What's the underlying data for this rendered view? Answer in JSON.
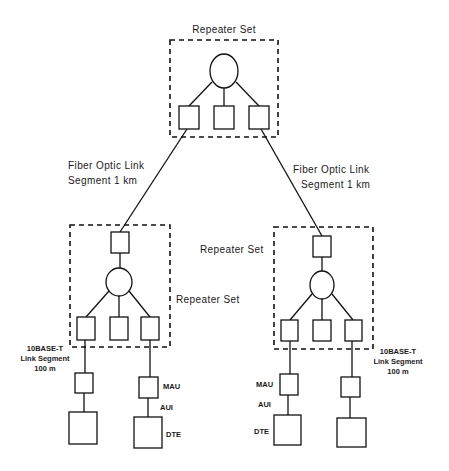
{
  "diagram": {
    "colors": {
      "line": "#111111",
      "background": "#ffffff"
    },
    "labels": {
      "top_repeater_set": "Repeater Set",
      "fiber_left_line1": "Fiber Optic Link",
      "fiber_left_line2": "Segment 1 km",
      "fiber_right_line1": "Fiber Optic Link",
      "fiber_right_line2": "Segment 1 km",
      "mid_repeater_set_upper": "Repeater Set",
      "mid_repeater_set_lower": "Repeater Set",
      "left_10baset_line1": "10BASE-T",
      "left_10baset_line2": "Link Segment",
      "left_10baset_line3": "100 m",
      "right_10baset_line1": "10BASE-T",
      "right_10baset_line2": "Link Segment",
      "right_10baset_line3": "100 m",
      "left_mau": "MAU",
      "left_aui": "AUI",
      "left_dte": "DTE",
      "right_mau": "MAU",
      "right_aui": "AUI",
      "right_dte": "DTE"
    },
    "nodes": [
      {
        "id": "top-repeater",
        "type": "repeater-hub"
      },
      {
        "id": "left-repeater",
        "type": "repeater-hub"
      },
      {
        "id": "right-repeater",
        "type": "repeater-hub"
      },
      {
        "id": "left-mau-1",
        "type": "MAU"
      },
      {
        "id": "left-dte-1",
        "type": "DTE"
      },
      {
        "id": "left-mau-2",
        "type": "MAU"
      },
      {
        "id": "left-dte-2",
        "type": "DTE"
      },
      {
        "id": "right-mau-1",
        "type": "MAU"
      },
      {
        "id": "right-dte-1",
        "type": "DTE"
      },
      {
        "id": "right-mau-2",
        "type": "MAU"
      },
      {
        "id": "right-dte-2",
        "type": "DTE"
      }
    ],
    "edges": [
      {
        "from": "top-repeater",
        "to": "left-repeater",
        "label": "Fiber Optic Link Segment 1 km"
      },
      {
        "from": "top-repeater",
        "to": "right-repeater",
        "label": "Fiber Optic Link Segment 1 km"
      },
      {
        "from": "left-repeater",
        "to": "left-mau-1",
        "label": "10BASE-T Link Segment 100 m"
      },
      {
        "from": "left-repeater",
        "to": "left-mau-2"
      },
      {
        "from": "left-mau-2",
        "to": "left-dte-2",
        "label": "AUI"
      },
      {
        "from": "left-mau-1",
        "to": "left-dte-1"
      },
      {
        "from": "right-repeater",
        "to": "right-mau-1"
      },
      {
        "from": "right-repeater",
        "to": "right-mau-2",
        "label": "10BASE-T Link Segment 100 m"
      },
      {
        "from": "right-mau-1",
        "to": "right-dte-1",
        "label": "AUI"
      },
      {
        "from": "right-mau-2",
        "to": "right-dte-2"
      }
    ]
  }
}
